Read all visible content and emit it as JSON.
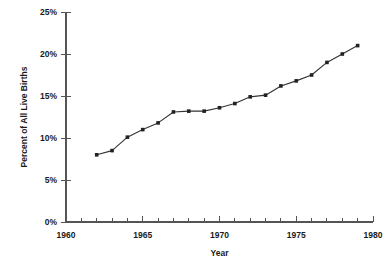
{
  "chart_data": {
    "type": "line",
    "title": "",
    "xlabel": "Year",
    "ylabel": "Percent of All Live Births",
    "xlim": [
      1960,
      1980
    ],
    "ylim": [
      0,
      25
    ],
    "grid": false,
    "legend": null,
    "x_tick_labels": [
      "1960",
      "1965",
      "1970",
      "1975",
      "1980"
    ],
    "x_major_ticks": [
      1960,
      1965,
      1970,
      1975,
      1980
    ],
    "x_minor_tick_step": 1,
    "y_tick_labels": [
      "0%",
      "5%",
      "10%",
      "15%",
      "20%",
      "25%"
    ],
    "y_major_ticks": [
      0,
      5,
      10,
      15,
      20,
      25
    ],
    "x": [
      1962,
      1963,
      1964,
      1965,
      1966,
      1967,
      1968,
      1969,
      1970,
      1971,
      1972,
      1973,
      1974,
      1975,
      1976,
      1977,
      1978,
      1979
    ],
    "values": [
      8.0,
      8.5,
      10.1,
      11.0,
      11.8,
      13.1,
      13.2,
      13.2,
      13.6,
      14.1,
      14.9,
      15.1,
      16.2,
      16.8,
      17.5,
      19.0,
      20.0,
      21.0
    ],
    "series": [
      {
        "name": "Percent of All Live Births",
        "color": "#333333",
        "marker": "square",
        "values": [
          8.0,
          8.5,
          10.1,
          11.0,
          11.8,
          13.1,
          13.2,
          13.2,
          13.6,
          14.1,
          14.9,
          15.1,
          16.2,
          16.8,
          17.5,
          19.0,
          20.0,
          21.0
        ]
      }
    ]
  },
  "axes": {
    "y_title": "Percent of All Live Births",
    "x_title": "Year"
  },
  "colors": {
    "line": "#333333",
    "axis": "#555555",
    "text": "#1a1a1a",
    "background": "#ffffff"
  }
}
